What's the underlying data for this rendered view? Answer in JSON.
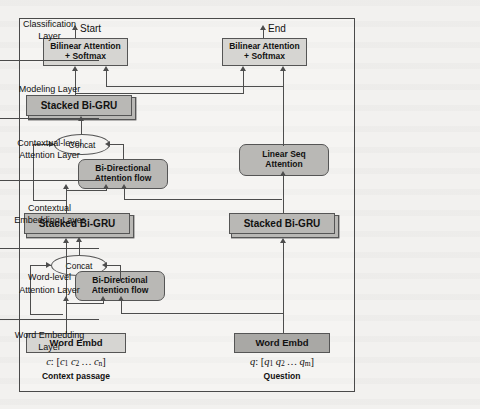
{
  "diagram": {
    "outputs": {
      "start_label": "Start",
      "end_label": "End"
    },
    "nodes": {
      "bilinear_start": "Bilinear Attention\n+ Softmax",
      "bilinear_start_l1": "Bilinear Attention",
      "bilinear_start_l2": "+ Softmax",
      "bilinear_end_l1": "Bilinear Attention",
      "bilinear_end_l2": "+ Softmax",
      "stacked_bigru_modeling": "Stacked Bi-GRU",
      "concat_upper": "Concat",
      "bidaf_upper_l1": "Bi-Directional",
      "bidaf_upper_l2": "Attention flow",
      "linear_seq_attention_l1": "Linear Seq",
      "linear_seq_attention_l2": "Attention",
      "stacked_bigru_context": "Stacked Bi-GRU",
      "stacked_bigru_question": "Stacked Bi-GRU",
      "concat_lower": "Concat",
      "bidaf_lower_l1": "Bi-Directional",
      "bidaf_lower_l2": "Attention flow",
      "word_embd_context": "Word Embd",
      "word_embd_question": "Word Embd"
    },
    "inputs": {
      "context_symbol": "c",
      "context_sequence": "[c1 c2 ... cn]",
      "context_caption": "Context passage",
      "question_symbol": "q",
      "question_sequence": "[q1 q2 ... qm]",
      "question_caption": "Question"
    },
    "layers": [
      {
        "line1": "Classification",
        "line2": "Layer"
      },
      {
        "line1": "Modeling Layer",
        "line2": ""
      },
      {
        "line1": "Contextual-level",
        "line2": "Attention Layer"
      },
      {
        "line1": "Contextual",
        "line2": "Embedding Layer"
      },
      {
        "line1": "Word-level",
        "line2": "Attention Layer"
      },
      {
        "line1": "Word Embedding",
        "line2": "Layer"
      }
    ],
    "colors": {
      "node_light": "#d6d5d2",
      "node_mid": "#b9b8b5",
      "node_dark": "#a9a8a5",
      "stroke": "#4d4d4d",
      "page_background": "#f2f1ef"
    }
  }
}
